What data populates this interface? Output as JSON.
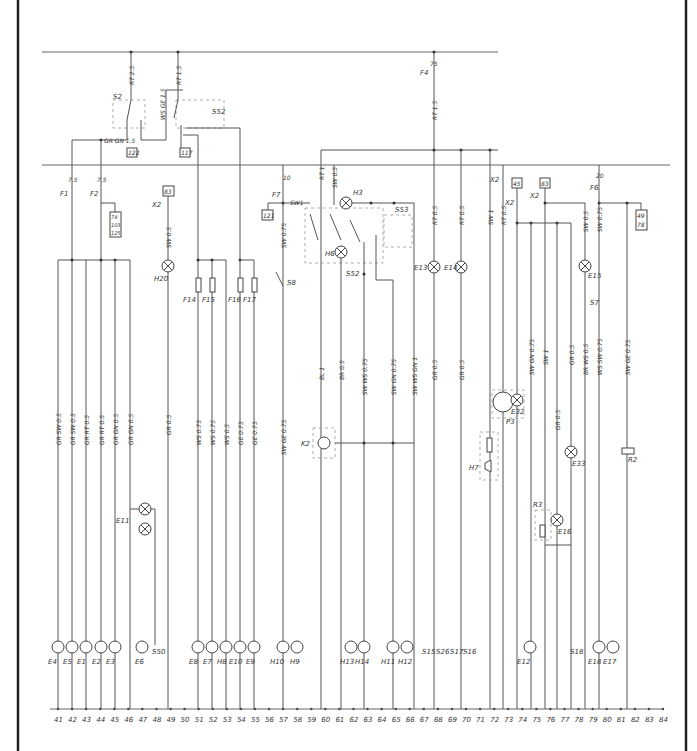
{
  "diagram": {
    "type": "electrical wiring schematic",
    "top_bus": {
      "fuses": [
        {
          "id": "F4",
          "rating": "75",
          "wire": "RT 1.5"
        }
      ]
    },
    "top_components": [
      {
        "id": "S2",
        "terminals": [
          "30",
          "58",
          "56"
        ],
        "wire_in": "RT 2.5"
      },
      {
        "id": "S52",
        "terminals": [
          "56a",
          "56b"
        ],
        "wire_in": "RT 1.5",
        "wire_link": "WS GE 1.5"
      },
      {
        "id": "GR GN 1.5",
        "role": "wire label"
      }
    ],
    "connector_refs": [
      "122",
      "117",
      "83",
      "74",
      "103",
      "125",
      "121",
      "45",
      "83",
      "49",
      "78"
    ],
    "fuses": [
      {
        "id": "F1",
        "rating": "7.5"
      },
      {
        "id": "F2",
        "rating": "7.5"
      },
      {
        "id": "F7",
        "rating": "10"
      },
      {
        "id": "F6",
        "rating": "20"
      },
      {
        "id": "F14"
      },
      {
        "id": "F15"
      },
      {
        "id": "F16"
      },
      {
        "id": "F17"
      }
    ],
    "connectors": [
      "X2",
      "X2",
      "X2",
      "X2"
    ],
    "switches": [
      "S8",
      "S52",
      "S53",
      "S50",
      "S15",
      "S26",
      "S17",
      "S16",
      "S18",
      "S7"
    ],
    "lamps": [
      "H20",
      "H3",
      "H6",
      "E13",
      "E14",
      "E11",
      "E4",
      "E5",
      "E1",
      "E2",
      "E3",
      "E6",
      "E8",
      "E7",
      "H8",
      "E10",
      "E9",
      "H10",
      "H9",
      "H13",
      "H14",
      "H11",
      "H12",
      "E12",
      "E15",
      "E16",
      "E17",
      "E18",
      "E32",
      "E33"
    ],
    "other_components": [
      {
        "id": "K2",
        "terminals": [
          "49",
          "49a",
          "31"
        ]
      },
      {
        "id": "H7",
        "type": "horn"
      },
      {
        "id": "P3",
        "type": "gauge"
      },
      {
        "id": "R2"
      },
      {
        "id": "R3"
      }
    ],
    "wire_labels_upper": [
      "SW 0.5",
      "SW 0.75",
      "SW1",
      "RT 1",
      "SW 0.5",
      "RT 0.5",
      "RT 0.5",
      "SW 1",
      "RT 0.5",
      "SW 0.5",
      "SW 0.75"
    ],
    "wire_labels_mid": [
      "GR SW 0.5",
      "GR SW 0.5",
      "GR RT 0.5",
      "GR RT 0.5",
      "GR GN 0.5",
      "GR GN 0.5",
      "GR 0.5",
      "WS 0.75",
      "WS 0.75",
      "WS 0.5",
      "GE 0.75",
      "GE 0.75",
      "SW GE 0.75",
      "BL 1",
      "BR 0.5",
      "SW WS 0.75",
      "SW GN 0.75",
      "SW WS GN 1",
      "GR 0.5",
      "GR 0.5",
      "SW GN 0.75",
      "SW 1",
      "GR 0.5",
      "BR WS 0.5",
      "WS SW 0.75",
      "SW GE 0.75",
      "GR 0.5"
    ],
    "wire_labels_lower": [
      "BR 0.5",
      "BR 0.5",
      "BR 0.5",
      "BR 0.75",
      "BR 0.75",
      "SW GE 0.5",
      "BR 0.75",
      "SW WS 0.75",
      "BR 0.75",
      "SW GN 0.75",
      "BR 0.75",
      "GR 0.5",
      "BR 0.5",
      "GR 0.5",
      "BR 2.5",
      "BR 0.5",
      "GR 0.5",
      "BR 0.75",
      "BR 1",
      "BR 0.5",
      "WS SW 0.5"
    ],
    "terminal_numbers": [
      "41",
      "42",
      "43",
      "44",
      "45",
      "46",
      "47",
      "48",
      "49",
      "50",
      "51",
      "52",
      "53",
      "54",
      "55",
      "56",
      "57",
      "58",
      "59",
      "60",
      "61",
      "62",
      "63",
      "64",
      "65",
      "66",
      "67",
      "68",
      "69",
      "70",
      "71",
      "72",
      "73",
      "74",
      "75",
      "76",
      "77",
      "78",
      "79",
      "80",
      "81",
      "82",
      "83",
      "84"
    ]
  }
}
